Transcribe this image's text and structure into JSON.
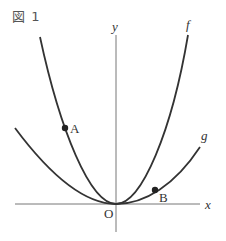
{
  "figure": {
    "title": "図 1",
    "axes": {
      "x_label": "x",
      "y_label": "y",
      "origin_label": "O"
    },
    "curves": [
      {
        "name": "f",
        "label": "f",
        "description": "steeper parabola through origin"
      },
      {
        "name": "g",
        "label": "g",
        "description": "wider parabola through origin"
      }
    ],
    "points": [
      {
        "name": "A",
        "label": "A",
        "on_curve": "f",
        "side": "left"
      },
      {
        "name": "B",
        "label": "B",
        "on_curve": "g",
        "side": "right"
      }
    ],
    "colors": {
      "curve": "#333333",
      "axis": "#666666",
      "text": "#333333"
    }
  }
}
